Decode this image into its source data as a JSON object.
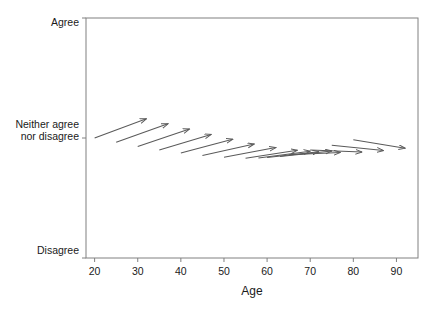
{
  "chart_data": {
    "type": "scatter",
    "title": "",
    "xlabel": "Age",
    "ylabel": "",
    "xlim": [
      18,
      95
    ],
    "ylim": [
      0,
      2
    ],
    "grid": false,
    "legend": null,
    "xticks": [
      20,
      30,
      40,
      50,
      60,
      70,
      80,
      90
    ],
    "xticklabels": [
      "20",
      "30",
      "40",
      "50",
      "60",
      "70",
      "80",
      "90"
    ],
    "yticks": [
      2,
      1,
      0
    ],
    "yticklabels": [
      "Agree",
      "Neither agree\nnor disagree",
      "Disagree"
    ],
    "ytick_label_top": "Agree",
    "ytick_label_mid_line1": "Neither agree",
    "ytick_label_mid_line2": "nor disagree",
    "ytick_label_bottom": "Disagree",
    "series": [
      {
        "name": "change vectors",
        "marker": "arrow",
        "color": "#5a5a5a",
        "arrows": [
          {
            "x0": 20.0,
            "y0": 1.0,
            "x1": 32.0,
            "y1": 1.16
          },
          {
            "x0": 25.0,
            "y0": 0.965,
            "x1": 37.0,
            "y1": 1.118
          },
          {
            "x0": 30.0,
            "y0": 0.93,
            "x1": 42.0,
            "y1": 1.075
          },
          {
            "x0": 35.0,
            "y0": 0.9,
            "x1": 47.0,
            "y1": 1.03
          },
          {
            "x0": 40.0,
            "y0": 0.875,
            "x1": 52.0,
            "y1": 0.99
          },
          {
            "x0": 45.0,
            "y0": 0.855,
            "x1": 57.0,
            "y1": 0.95
          },
          {
            "x0": 50.0,
            "y0": 0.84,
            "x1": 62.0,
            "y1": 0.92
          },
          {
            "x0": 55.0,
            "y0": 0.832,
            "x1": 67.0,
            "y1": 0.898
          },
          {
            "x0": 60.0,
            "y0": 0.838,
            "x1": 72.0,
            "y1": 0.885
          },
          {
            "x0": 65.0,
            "y0": 0.86,
            "x1": 77.0,
            "y1": 0.88
          },
          {
            "x0": 70.0,
            "y0": 0.9,
            "x1": 82.0,
            "y1": 0.883
          },
          {
            "x0": 75.0,
            "y0": 0.94,
            "x1": 87.0,
            "y1": 0.895
          },
          {
            "x0": 80.0,
            "y0": 0.985,
            "x1": 92.0,
            "y1": 0.915
          },
          {
            "x0": 63.0,
            "y0": 0.845,
            "x1": 75.0,
            "y1": 0.892
          },
          {
            "x0": 58.0,
            "y0": 0.833,
            "x1": 70.0,
            "y1": 0.89
          }
        ]
      }
    ],
    "axis_color": "#808080",
    "frame": {
      "left": 86,
      "right": 418,
      "top": 18,
      "bottom": 258
    }
  }
}
